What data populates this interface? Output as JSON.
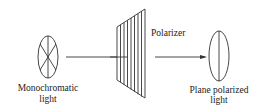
{
  "diagram": {
    "labels": {
      "source_line1": "Monochromatic",
      "source_line2": "light",
      "polarizer": "Polarizer",
      "output_line1": "Plane polarized",
      "output_line2": "light"
    },
    "elements": [
      {
        "id": "source",
        "shape": "ellipse-with-radial-lines",
        "meaning": "unpolarized light vibrating in all directions"
      },
      {
        "id": "polarizer",
        "shape": "slanted-panel-with-vertical-slits"
      },
      {
        "id": "output",
        "shape": "ellipse-with-vertical-line",
        "meaning": "light vibrating in one plane"
      }
    ],
    "arrows": [
      {
        "from": "source",
        "to": "polarizer"
      },
      {
        "from": "polarizer",
        "to": "output"
      }
    ],
    "colors": {
      "stroke": "#333333",
      "background": "#ffffff"
    }
  }
}
